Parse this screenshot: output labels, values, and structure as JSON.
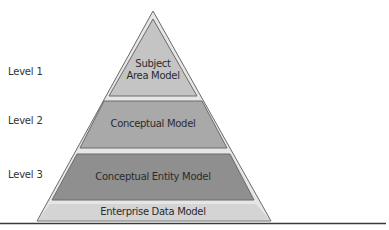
{
  "diagram": {
    "type": "pyramid",
    "levels": [
      {
        "label": "Level 1",
        "model": "Subject Area Model",
        "model_lines": [
          "Subject",
          "Area Model"
        ]
      },
      {
        "label": "Level 2",
        "model": "Conceptual Model"
      },
      {
        "label": "Level 3",
        "model": "Conceptual Entity Model"
      }
    ],
    "base": {
      "model": "Enterprise Data Model"
    },
    "colors": {
      "outer": "#e3e3e3",
      "level1": "#bdbdbd",
      "level2": "#a6a6a6",
      "level3": "#8e8e8e",
      "base": "#d6d6d6",
      "edge": "#6a6a6a",
      "rule": "#3a3a3a"
    }
  }
}
